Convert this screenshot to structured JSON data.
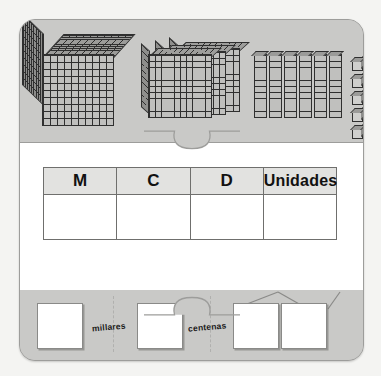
{
  "worksheet": {
    "title": "Base-ten blocks place value worksheet",
    "card_color": "#c9c9c7",
    "band_color": "#ffffff",
    "border_color": "#9d9d9b"
  },
  "blocks_section": {
    "name": "base-ten-blocks-display",
    "groups": [
      {
        "key": "thousands",
        "icon": "thousand-cube-icon",
        "count": 1,
        "place": "M",
        "unit_value": 1000,
        "total": 1000
      },
      {
        "key": "hundreds",
        "icon": "hundred-flat-icon",
        "count": 3,
        "place": "C",
        "unit_value": 100,
        "total": 300
      },
      {
        "key": "tens",
        "icon": "ten-rod-icon",
        "count": 6,
        "place": "D",
        "unit_value": 10,
        "total": 60
      },
      {
        "key": "units",
        "icon": "unit-cube-icon",
        "count": 5,
        "place": "Unidades",
        "unit_value": 1,
        "total": 5
      }
    ]
  },
  "place_value_table": {
    "name": "place-value-table",
    "headers": [
      "M",
      "C",
      "D",
      "Unidades"
    ],
    "values": [
      "",
      "",
      "",
      ""
    ]
  },
  "answer_section": {
    "name": "answer-boxes-row",
    "boxes": [
      {
        "id": "answer-box-1",
        "value": ""
      },
      {
        "id": "answer-box-2",
        "value": ""
      },
      {
        "id": "answer-box-3",
        "value": ""
      },
      {
        "id": "answer-box-4",
        "value": ""
      }
    ],
    "labels": {
      "millares": "millares",
      "centenas": "centenas"
    }
  },
  "connectors": {
    "top": "puzzle-tab-down",
    "bottom": "puzzle-tab-up"
  }
}
